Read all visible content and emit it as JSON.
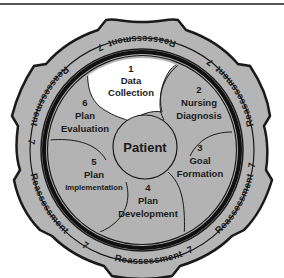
{
  "diagram": {
    "center": {
      "label": "Patient"
    },
    "steps": [
      {
        "number": "1",
        "lines": [
          "Data",
          "Collection"
        ],
        "fill": "#ffffff"
      },
      {
        "number": "2",
        "lines": [
          "Nursing",
          "Diagnosis"
        ],
        "fill": "#b3b3b3"
      },
      {
        "number": "3",
        "lines": [
          "Goal",
          "Formation"
        ],
        "fill": "#b3b3b3"
      },
      {
        "number": "4",
        "lines": [
          "Plan",
          "Development"
        ],
        "fill": "#b3b3b3"
      },
      {
        "number": "5",
        "lines": [
          "Plan",
          "Implementation"
        ],
        "fill": "#b3b3b3"
      },
      {
        "number": "6",
        "lines": [
          "Plan",
          "Evaluation"
        ],
        "fill": "#b3b3b3"
      }
    ],
    "outer_ring": {
      "number": "7",
      "label": "Reassessment",
      "repeat_count": 6
    },
    "colors": {
      "ring_fill": "#b5b5b5",
      "segment_fill": "#b3b3b3",
      "highlight_fill": "#ffffff",
      "stroke": "#1a1a1a"
    }
  }
}
